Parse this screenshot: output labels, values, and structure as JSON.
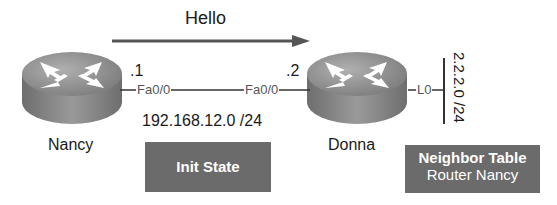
{
  "diagram": {
    "hello_label": "Hello",
    "routers": [
      {
        "name": "Nancy",
        "ip_suffix": ".1",
        "interface": "Fa0/0"
      },
      {
        "name": "Donna",
        "ip_suffix": ".2",
        "interface": "Fa0/0",
        "loopback_interface": "L0"
      }
    ],
    "link_network": "192.168.12.0 /24",
    "loopback_network": "2.2.2.0 /24",
    "state_box": "Init State",
    "neighbor_table": {
      "title": "Neighbor Table",
      "entry": "Router Nancy"
    },
    "colors": {
      "box_bg": "#6b6b6b",
      "arrow": "#555555",
      "router_body": "#8a8a8a"
    }
  }
}
